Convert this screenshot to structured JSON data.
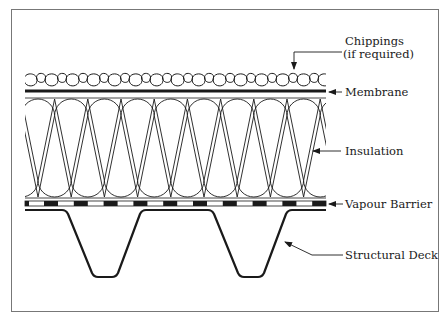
{
  "diagram": {
    "type": "roof-build-up-section",
    "colors": {
      "line": "#1a1a1a",
      "frame": "#777777",
      "background": "#ffffff"
    },
    "layers": [
      {
        "id": "chippings",
        "label": "Chippings",
        "sublabel": "(if required)"
      },
      {
        "id": "membrane",
        "label": "Membrane"
      },
      {
        "id": "insulation",
        "label": "Insulation"
      },
      {
        "id": "vapour_barrier",
        "label": "Vapour Barrier"
      },
      {
        "id": "structural_deck",
        "label": "Structural Deck"
      }
    ]
  }
}
